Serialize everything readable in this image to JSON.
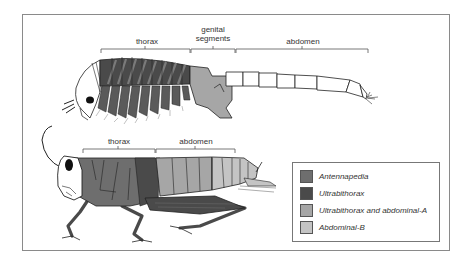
{
  "figure": {
    "top_animal": {
      "name": "crustacean (brine shrimp)",
      "labels": {
        "thorax": "thorax",
        "genital_segments_line1": "genital",
        "genital_segments_line2": "segments",
        "abdomen": "abdomen"
      }
    },
    "bottom_animal": {
      "name": "insect (grasshopper)",
      "labels": {
        "thorax": "thorax",
        "abdomen": "abdomen"
      }
    },
    "legend": {
      "items": [
        {
          "label": "Antennapedia",
          "color": "#6e6e6e"
        },
        {
          "label": "Ultrabithorax",
          "color": "#4a4a4a"
        },
        {
          "label": "Ultrabithorax and abdominal-A",
          "color": "#a6a6a6"
        },
        {
          "label": "Abdominal-B",
          "color": "#c4c4c4"
        }
      ]
    },
    "colors": {
      "frame": "#8a8a8a",
      "antennapedia": "#6e6e6e",
      "ultrabithorax": "#4a4a4a",
      "ubx_abda": "#a6a6a6",
      "abdb": "#c4c4c4",
      "outline": "#222222"
    }
  }
}
